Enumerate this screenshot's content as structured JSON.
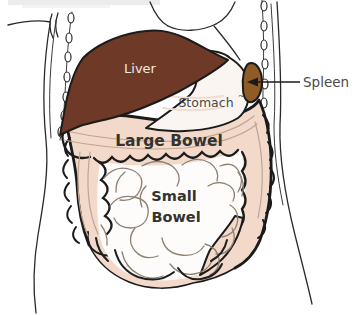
{
  "labels": {
    "liver": "Liver",
    "stomach": "Stomach",
    "stomach_mark": "~",
    "spleen": "Spleen",
    "large_bowel": "Large Bowel",
    "small_bowel_line1": "Small",
    "small_bowel_line2": "Bowel"
  },
  "colors": {
    "liver": "#6e3926",
    "spleen": "#8f5c25",
    "large_bowel": "#f2d9ca",
    "small_bowel": "#fdfcfa",
    "stomach": "#faf5f0",
    "outline": "#1b1b1b",
    "label_text": "#33332f",
    "secondary_label_text": "#4a4a46",
    "liver_label_text": "#f2ece4",
    "coil_line": "#8e8175",
    "colon_inner_line": "#c2a492",
    "background": "#ffffff",
    "scan_artifact": "#ececec"
  }
}
